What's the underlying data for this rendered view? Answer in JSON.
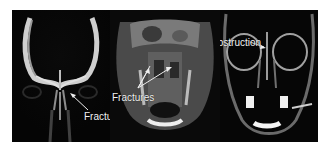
{
  "figure": {
    "panels": [
      {
        "view": "coronal CT skull",
        "annotation": "Fracture"
      },
      {
        "view": "axial CT face",
        "annotation": "Fractures"
      },
      {
        "view": "coronal CT face",
        "annotation": "Obstruction"
      }
    ]
  },
  "colors": {
    "background": "#ffffff",
    "scan_background": "#000000",
    "bone": "#d8d8d8",
    "annotation": "#f2f2f2"
  }
}
